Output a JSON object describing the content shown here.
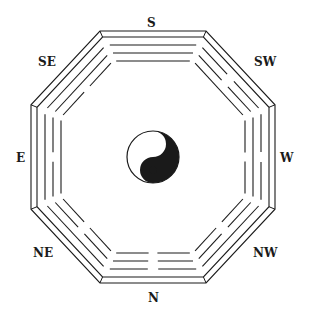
{
  "diagram": {
    "colors": {
      "ink": "#1a1a1a",
      "paper": "#ffffff"
    },
    "center": {
      "x": 153,
      "y": 157
    },
    "labels": [
      {
        "key": "S",
        "text": "S",
        "x": 147,
        "y": 17
      },
      {
        "key": "SW",
        "text": "SW",
        "x": 254,
        "y": 56
      },
      {
        "key": "W",
        "text": "W",
        "x": 280,
        "y": 152
      },
      {
        "key": "NW",
        "text": "NW",
        "x": 253,
        "y": 247
      },
      {
        "key": "N",
        "text": "N",
        "x": 148,
        "y": 292
      },
      {
        "key": "NE",
        "text": "NE",
        "x": 33,
        "y": 247
      },
      {
        "key": "E",
        "text": "E",
        "x": 16,
        "y": 152
      },
      {
        "key": "SE",
        "text": "SE",
        "x": 38,
        "y": 56
      }
    ],
    "trigrams": [
      {
        "direction": "S",
        "lines_outer_to_inner": [
          "solid",
          "solid",
          "solid"
        ]
      },
      {
        "direction": "SW",
        "lines_outer_to_inner": [
          "broken",
          "broken",
          "solid"
        ]
      },
      {
        "direction": "W",
        "lines_outer_to_inner": [
          "broken",
          "solid",
          "broken"
        ]
      },
      {
        "direction": "NW",
        "lines_outer_to_inner": [
          "solid",
          "broken",
          "broken"
        ]
      },
      {
        "direction": "N",
        "lines_outer_to_inner": [
          "broken",
          "broken",
          "broken"
        ]
      },
      {
        "direction": "NE",
        "lines_outer_to_inner": [
          "solid",
          "broken",
          "broken"
        ]
      },
      {
        "direction": "E",
        "lines_outer_to_inner": [
          "solid",
          "broken",
          "solid"
        ]
      },
      {
        "direction": "SE",
        "lines_outer_to_inner": [
          "solid",
          "solid",
          "broken"
        ]
      }
    ],
    "center_symbol": {
      "name": "yin-yang",
      "radius": 26
    }
  }
}
